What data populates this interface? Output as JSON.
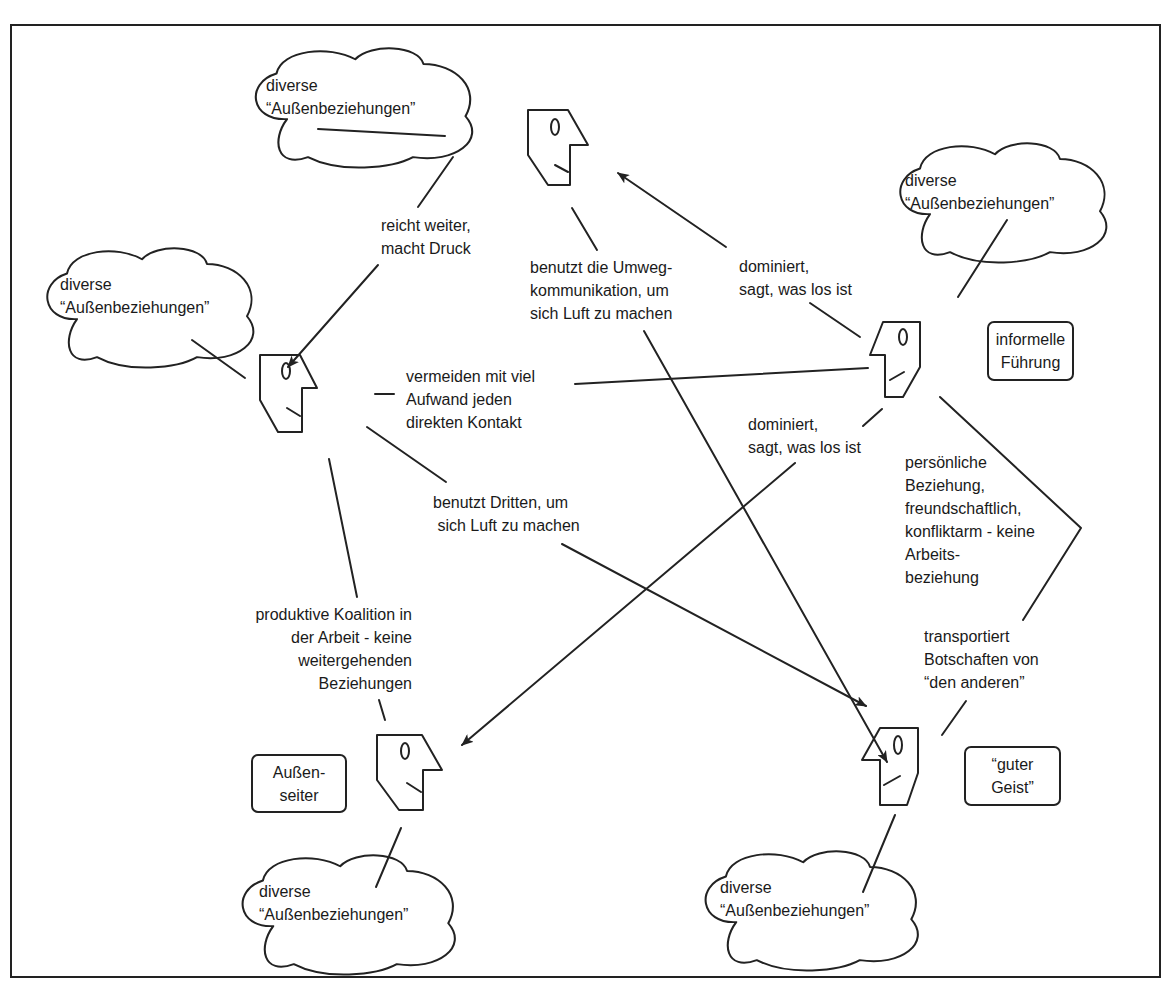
{
  "diagram": {
    "type": "relationship-network",
    "cloud_label": "diverse\n“Außenbeziehungen”",
    "persons": [
      {
        "id": "top",
        "facing": "right"
      },
      {
        "id": "left",
        "facing": "right"
      },
      {
        "id": "right",
        "facing": "left",
        "role": "informelle\nFührung"
      },
      {
        "id": "bottom-left",
        "facing": "right",
        "role": "Außen-\nseiter"
      },
      {
        "id": "bottom-right",
        "facing": "left",
        "role": "“guter\nGeist”"
      }
    ],
    "clouds": [
      {
        "id": "cloud-top",
        "text": "diverse\n“Außenbeziehungen”"
      },
      {
        "id": "cloud-left",
        "text": "diverse\n“Außenbeziehungen”"
      },
      {
        "id": "cloud-right",
        "text": "diverse\n“Außenbeziehungen”"
      },
      {
        "id": "cloud-bottom-left",
        "text": "diverse\n“Außenbeziehungen”"
      },
      {
        "id": "cloud-bottom-right",
        "text": "diverse\n“Außenbeziehungen”"
      }
    ],
    "roles": {
      "right": "informelle\nFührung",
      "bottom_left": "Außen-\nseiter",
      "bottom_right": "“guter\nGeist”"
    },
    "edges": {
      "top_to_left": "reicht weiter,\nmacht Druck",
      "top_to_bottom_right": "benutzt die Umweg-\nkommunikation, um\nsich Luft zu machen",
      "right_to_top": "dominiert,\nsagt, was los ist",
      "left_right": "vermeiden mit viel\nAufwand jeden\ndirekten Kontakt",
      "right_to_bottom_left": "dominiert,\nsagt, was los ist",
      "left_to_bottom_right": "benutzt Dritten, um\n sich Luft zu machen",
      "right_bottom_right": "persönliche\nBeziehung,\nfreundschaftlich,\nkonfliktarm - keine\nArbeits-\nbeziehung",
      "bottom_right_transport": "transportiert\nBotschaften von\n“den anderen”",
      "left_bottom_left": "produktive Koalition in\nder Arbeit - keine\nweitergehenden\nBeziehungen"
    },
    "colors": {
      "stroke": "#222222",
      "background": "#ffffff",
      "text": "#1a1a1a"
    }
  }
}
